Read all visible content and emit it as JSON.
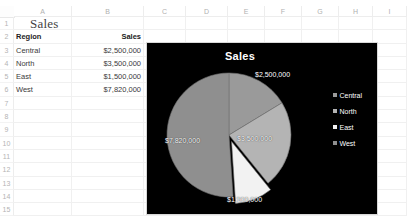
{
  "spreadsheet": {
    "column_headers": [
      "A",
      "B",
      "C",
      "D",
      "E",
      "F",
      "G",
      "H",
      "I"
    ],
    "row_headers": [
      "1",
      "2",
      "3",
      "4",
      "5",
      "6",
      "7",
      "8",
      "9",
      "10",
      "11",
      "12",
      "13",
      "14",
      "15"
    ],
    "title_cell": "Sales",
    "table_headers": {
      "region": "Region",
      "sales": "Sales"
    },
    "rows": [
      {
        "region": "Central",
        "sales": "$2,500,000"
      },
      {
        "region": "North",
        "sales": "$3,500,000"
      },
      {
        "region": "East",
        "sales": "$1,500,000"
      },
      {
        "region": "West",
        "sales": "$7,820,000"
      }
    ]
  },
  "chart": {
    "title": "Sales",
    "background_color": "#000000",
    "legend": [
      {
        "label": "Central",
        "color": "#9a9a9a"
      },
      {
        "label": "North",
        "color": "#b4b4b4"
      },
      {
        "label": "East",
        "color": "#f2f2f2"
      },
      {
        "label": "West",
        "color": "#8f8f8f"
      }
    ],
    "labels": {
      "central": "$2,500,000",
      "north": "$3,500,000",
      "east": "$1,500,000",
      "west": "$7,820,000"
    }
  },
  "chart_data": {
    "type": "pie",
    "title": "Sales",
    "categories": [
      "Central",
      "North",
      "East",
      "West"
    ],
    "values": [
      2500000,
      3500000,
      1500000,
      7820000
    ],
    "data_labels": [
      "$2,500,000",
      "$3,500,000",
      "$1,500,000",
      "$7,820,000"
    ],
    "colors": [
      "#9a9a9a",
      "#b4b4b4",
      "#f2f2f2",
      "#8f8f8f"
    ],
    "total": 15320000,
    "percentages": [
      16.3,
      22.8,
      9.8,
      51.0
    ],
    "legend_position": "right",
    "exploded_slice": "East",
    "xlabel": "",
    "ylabel": ""
  }
}
